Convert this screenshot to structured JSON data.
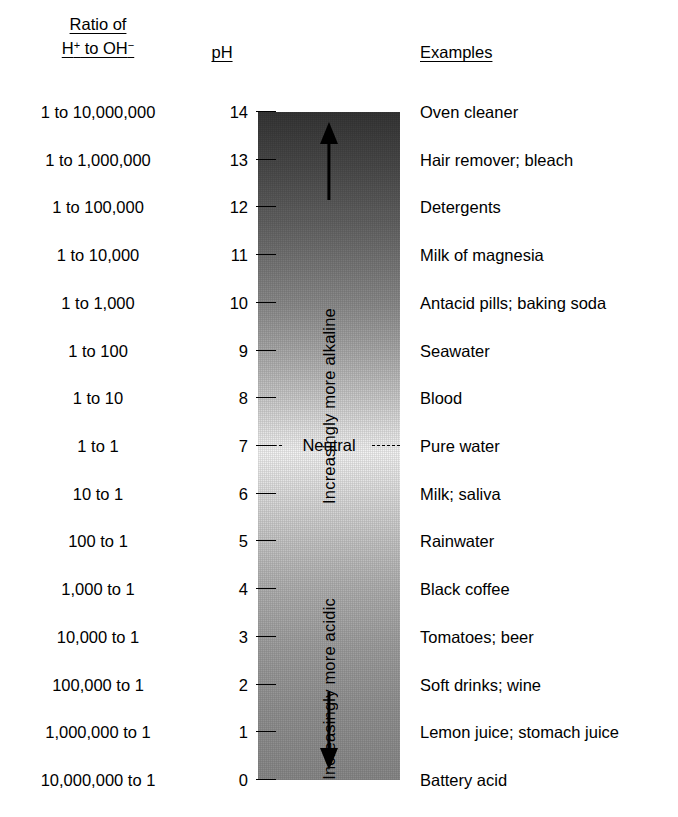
{
  "headers": {
    "ratio_line1": "Ratio of",
    "ratio_line2_prefix": "H",
    "ratio_line2_sup1": "+",
    "ratio_line2_mid": " to OH",
    "ratio_line2_sup2": "−",
    "ph": "pH",
    "examples": "Examples"
  },
  "neutral": {
    "label": "Neutral"
  },
  "axis_labels": {
    "alkaline": "Increasingly more alkaline",
    "acidic": "Increasingly more acidic"
  },
  "icons": {
    "arrow_up": "arrow-up-icon",
    "arrow_down": "arrow-down-icon"
  },
  "colors": {
    "bar_top": "#363636",
    "bar_middle": "#f4f4f4",
    "bar_bottom": "#8a8a8a",
    "text": "#000000",
    "background": "#ffffff"
  },
  "chart_data": {
    "type": "table",
    "columns": [
      "Ratio of H+ to OH−",
      "pH",
      "Examples"
    ],
    "ylim": [
      0,
      14
    ],
    "ylabel": "pH",
    "grid": false,
    "neutral_point": 7,
    "rows": [
      {
        "ratio": "1 to 10,000,000",
        "ph": "14",
        "example": "Oven cleaner"
      },
      {
        "ratio": "1 to 1,000,000",
        "ph": "13",
        "example": "Hair remover; bleach"
      },
      {
        "ratio": "1 to 100,000",
        "ph": "12",
        "example": "Detergents"
      },
      {
        "ratio": "1 to 10,000",
        "ph": "11",
        "example": "Milk of magnesia"
      },
      {
        "ratio": "1 to 1,000",
        "ph": "10",
        "example": "Antacid pills; baking soda"
      },
      {
        "ratio": "1 to 100",
        "ph": "9",
        "example": "Seawater"
      },
      {
        "ratio": "1 to 10",
        "ph": "8",
        "example": "Blood"
      },
      {
        "ratio": "1 to 1",
        "ph": "7",
        "example": "Pure water"
      },
      {
        "ratio": "10 to 1",
        "ph": "6",
        "example": "Milk; saliva"
      },
      {
        "ratio": "100 to 1",
        "ph": "5",
        "example": "Rainwater"
      },
      {
        "ratio": "1,000 to 1",
        "ph": "4",
        "example": "Black coffee"
      },
      {
        "ratio": "10,000 to 1",
        "ph": "3",
        "example": "Tomatoes; beer"
      },
      {
        "ratio": "100,000 to 1",
        "ph": "2",
        "example": "Soft drinks; wine"
      },
      {
        "ratio": "1,000,000 to 1",
        "ph": "1",
        "example": "Lemon juice; stomach juice"
      },
      {
        "ratio": "10,000,000 to 1",
        "ph": "0",
        "example": "Battery acid"
      }
    ]
  }
}
